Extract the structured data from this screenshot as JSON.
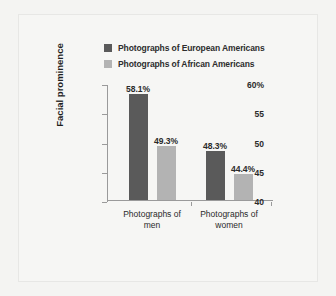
{
  "chart_data": {
    "type": "bar",
    "title": "",
    "xlabel": "",
    "ylabel": "Facial prominence",
    "ylim": [
      40,
      60
    ],
    "grid": false,
    "legend_position": "top",
    "categories": [
      "Photographs of men",
      "Photographs of women"
    ],
    "category_lines": [
      [
        "Photographs of",
        "men"
      ],
      [
        "Photographs of",
        "women"
      ]
    ],
    "ytick_labels": [
      "60%",
      "55",
      "50",
      "45",
      "40"
    ],
    "ytick_values": [
      60,
      55,
      50,
      45,
      40
    ],
    "series": [
      {
        "name": "Photographs of European Americans",
        "color": "#5a5a5a",
        "values": [
          58.1,
          49.3
        ],
        "labels": [
          "58.1%",
          "48.3%"
        ]
      },
      {
        "name": "Photographs of African Americans",
        "color": "#b3b3b3",
        "values": [
          49.3,
          44.4
        ],
        "labels": [
          "49.3%",
          "44.4%"
        ]
      }
    ],
    "bars": [
      {
        "group": "Photographs of men",
        "series": "Photographs of European Americans",
        "value": 58.1,
        "label": "58.1%",
        "color": "#5a5a5a"
      },
      {
        "group": "Photographs of men",
        "series": "Photographs of African Americans",
        "value": 49.3,
        "label": "49.3%",
        "color": "#b3b3b3"
      },
      {
        "group": "Photographs of women",
        "series": "Photographs of European Americans",
        "value": 48.3,
        "label": "48.3%",
        "color": "#5a5a5a"
      },
      {
        "group": "Photographs of women",
        "series": "Photographs of African Americans",
        "value": 44.4,
        "label": "44.4%",
        "color": "#b3b3b3"
      }
    ]
  },
  "legend": {
    "items": [
      {
        "label": "Photographs of European Americans",
        "color": "#5a5a5a"
      },
      {
        "label": "Photographs of African Americans",
        "color": "#b3b3b3"
      }
    ]
  },
  "axis": {
    "y_title": "Facial prominence"
  },
  "colors": {
    "background": "#f4f4f2",
    "panel": "#f6f6f4",
    "axis": "#9a9a9a",
    "text": "#2a2a2a",
    "series_dark": "#5a5a5a",
    "series_light": "#b3b3b3"
  }
}
